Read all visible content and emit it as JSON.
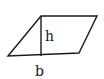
{
  "diagram": {
    "type": "parallelogram",
    "shape": {
      "vertices": [
        [
          41,
          16
        ],
        [
          97,
          16
        ],
        [
          79,
          53
        ],
        [
          8,
          56
        ]
      ],
      "stroke": "#1a1a1a"
    },
    "height_line": {
      "x": 41,
      "y1": 16,
      "y2": 55
    },
    "labels": {
      "height": "h",
      "base": "b"
    }
  }
}
